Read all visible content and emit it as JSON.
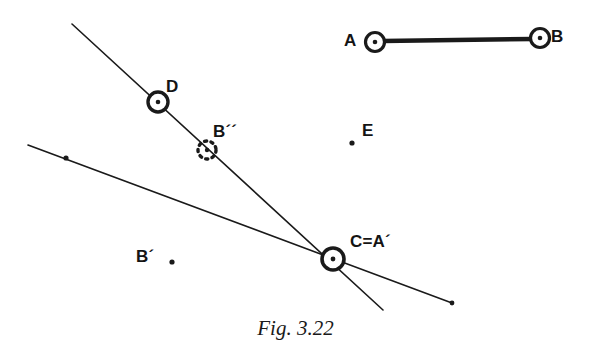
{
  "figure": {
    "caption": "Fig. 3.22",
    "ink_color": "#1a1a1a",
    "background_color": "#ffffff",
    "labels": {
      "a": "A",
      "b": "B",
      "d": "D",
      "b_double_prime": "B´´",
      "b_prime": "B´",
      "e": "E",
      "c_equals_a_prime": "C=A´"
    },
    "geometry": {
      "segment_ab": {
        "x1": 383,
        "y1": 41,
        "x2": 532,
        "y2": 39,
        "stroke_width": 4.5
      },
      "steep_line": {
        "x1": 72,
        "y1": 24,
        "x2": 383,
        "y2": 310,
        "stroke_width": 1.6
      },
      "shallow_line": {
        "x1": 28,
        "y1": 145,
        "x2": 452,
        "y2": 303,
        "stroke_width": 1.6
      },
      "ring_points": [
        {
          "name": "A",
          "cx": 375,
          "cy": 42,
          "r": 9.5
        },
        {
          "name": "B",
          "cx": 540,
          "cy": 38,
          "r": 9.5
        },
        {
          "name": "D",
          "cx": 158,
          "cy": 102,
          "r": 10
        },
        {
          "name": "C=A´",
          "cx": 333,
          "cy": 259,
          "r": 11
        }
      ],
      "dashed_ring_point": {
        "name": "B´´",
        "cx": 207,
        "cy": 150,
        "r": 9
      },
      "dot_points": [
        {
          "name": "B´",
          "cx": 172,
          "cy": 262,
          "r": 2.6
        },
        {
          "name": "E",
          "cx": 352,
          "cy": 143,
          "r": 2.6
        },
        {
          "name": "shallow-line-tick",
          "cx": 66,
          "cy": 158,
          "r": 2.6
        },
        {
          "name": "shallow-line-end",
          "cx": 452,
          "cy": 303,
          "r": 2.4
        }
      ]
    },
    "label_positions": {
      "a": {
        "left": 344,
        "top": 32
      },
      "b": {
        "left": 551,
        "top": 28
      },
      "d": {
        "left": 166,
        "top": 78
      },
      "b_double_prime": {
        "left": 213,
        "top": 123
      },
      "b_prime": {
        "left": 136,
        "top": 248
      },
      "e": {
        "left": 362,
        "top": 122
      },
      "c_equals_a_prime": {
        "left": 350,
        "top": 233
      }
    }
  }
}
